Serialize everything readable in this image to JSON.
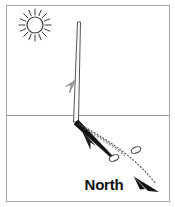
{
  "diagram": {
    "type": "line-art-illustration",
    "background_color": "#ffffff",
    "ink_color": "#222222",
    "frame": {
      "name": "illustration-border",
      "stroke_color": "#a8a8a8",
      "stroke_width": 1,
      "x": 6,
      "y": 5,
      "width": 163,
      "height": 196
    },
    "horizon": {
      "name": "horizon-line",
      "label": "ground horizon",
      "stroke_color": "#9a9a9a",
      "y": 115,
      "x_start": 6,
      "x_end": 169
    },
    "sun": {
      "name": "sun-icon",
      "label": "Sun",
      "center_x": 35,
      "center_y": 25,
      "core_radius": 8,
      "ray_count": 16,
      "ray_inner": 10,
      "ray_outer": 16,
      "stroke_color": "#3a3a3a"
    },
    "pole": {
      "name": "vertical-stick",
      "label": "Vertical stick (gnomon)",
      "top_x": 79,
      "top_y": 22,
      "base_x": 76,
      "base_y": 122,
      "width_top": 3,
      "width_base": 5,
      "stroke_color": "#555555"
    },
    "pole_marker": {
      "name": "stick-direction-arrow",
      "label": "downward arrow on stick",
      "x": 70,
      "y": 88
    },
    "shadow": {
      "name": "shadow-band",
      "label": "Shadow cast by the stick",
      "fill_color": "#151515",
      "start_x": 76,
      "start_y": 122,
      "end_x": 113,
      "end_y": 158,
      "thickness_start": 6,
      "thickness_end": 2
    },
    "shadow_arrow": {
      "name": "shadow-direction-arrow",
      "label": "arrow along shadow toward stick",
      "tip_x": 84,
      "tip_y": 133
    },
    "markers": [
      {
        "name": "pebble-marker-first",
        "label": "First shadow-tip pebble",
        "cx": 114,
        "cy": 158,
        "rx": 5,
        "ry": 3,
        "rotation": -22
      },
      {
        "name": "pebble-marker-second",
        "label": "Second shadow-tip pebble",
        "cx": 136,
        "cy": 150,
        "rx": 5,
        "ry": 3,
        "rotation": -22
      }
    ],
    "dotted_line": {
      "name": "east-west-dotted-line",
      "label": "dotted line through shadow tips",
      "stroke_color": "#555555",
      "dash": "1 2",
      "points": "78,124 120,150 150,178"
    },
    "north": {
      "name": "north-indicator",
      "label": "North",
      "text_x": 104,
      "text_y": 190,
      "arrow_tip_x": 158,
      "arrow_tip_y": 190,
      "arrow_color": "#111111"
    }
  }
}
